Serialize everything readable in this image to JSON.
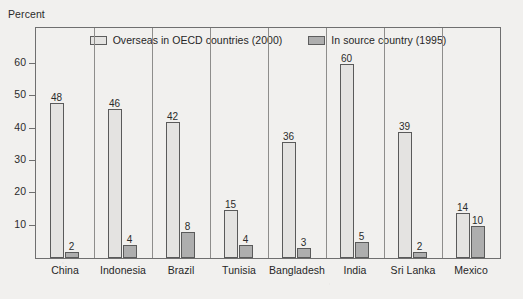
{
  "chart_data": {
    "type": "bar",
    "title": "",
    "ylabel": "Percent",
    "xlabel": "",
    "ylim": [
      0,
      65
    ],
    "yticks": [
      10,
      20,
      30,
      40,
      50,
      60
    ],
    "grid": false,
    "legend_position": "top-center",
    "categories": [
      "China",
      "Indonesia",
      "Brazil",
      "Tunisia",
      "Bangladesh",
      "India",
      "Sri Lanka",
      "Mexico"
    ],
    "series": [
      {
        "name": "Overseas in OECD countries (2000)",
        "color": "#e4e3e1",
        "values": [
          48,
          46,
          42,
          15,
          36,
          60,
          39,
          14
        ]
      },
      {
        "name": "In source country (1995)",
        "color": "#aeaeae",
        "values": [
          2,
          4,
          8,
          4,
          3,
          5,
          2,
          10
        ]
      }
    ]
  }
}
